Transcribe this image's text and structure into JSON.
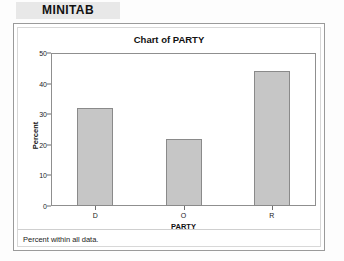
{
  "app": {
    "name": "MINITAB"
  },
  "panel": {
    "footer_note": "Percent within all data."
  },
  "chart_data": {
    "type": "bar",
    "title": "Chart of PARTY",
    "categories": [
      "D",
      "O",
      "R"
    ],
    "values": [
      32,
      22,
      44
    ],
    "xlabel": "PARTY",
    "ylabel": "Percent",
    "ylim": [
      0,
      50
    ],
    "ytick_labels": [
      "0",
      "10",
      "20",
      "30",
      "40",
      "50"
    ],
    "ytick_values": [
      0,
      10,
      20,
      30,
      40,
      50
    ],
    "grid": false,
    "legend": false,
    "bar_fill_color": "#c6c6c6",
    "bar_border_color": "#8a8a8a",
    "axis_color": "#8f8f8f",
    "background_color": "#ffffff"
  }
}
